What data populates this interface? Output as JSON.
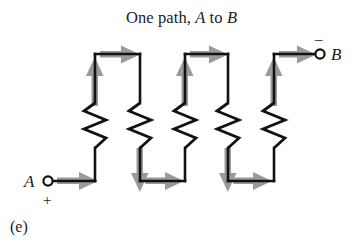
{
  "figure": {
    "title_prefix": "One path, ",
    "title_node_a": "A",
    "title_middle": " to ",
    "title_node_b": "B",
    "panel_label": "(e)",
    "terminal_a_label": "A",
    "terminal_a_sign": "+",
    "terminal_b_label": "B",
    "terminal_b_sign": "–",
    "colors": {
      "wire": "#121212",
      "arrow": "#9a9a9a",
      "background": "#ffffff",
      "text": "#1b1b1b"
    },
    "diagram_type": "series-circuit-schematic",
    "resistor_count": 5,
    "flow_direction": "A to B, single series path"
  }
}
